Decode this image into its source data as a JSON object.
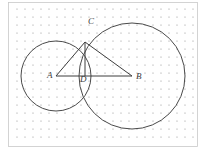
{
  "figure": {
    "canvas": {
      "width": 201,
      "height": 151
    },
    "background": {
      "color": "#ffffff",
      "grid": {
        "type": "dot-lattice",
        "spacing": 8.0,
        "origin_x": 13,
        "origin_y": 7,
        "dot_radius": 0.6,
        "color": "#8f8f8f"
      },
      "frame": {
        "left": 8.5,
        "top": 2.5,
        "right": 197.5,
        "bottom": 146.5,
        "color": "#c9c9c9",
        "width": 0.8
      }
    },
    "stroke": {
      "circle_color": "#4a4a4a",
      "circle_width": 1.0,
      "line_color": "#3d3d3d",
      "line_width": 1.0
    },
    "circles": [
      {
        "id": "circle-a",
        "center_label": "A",
        "cx": 56,
        "cy": 76,
        "r": 35
      },
      {
        "id": "circle-b",
        "center_label": "B",
        "cx": 132,
        "cy": 76,
        "r": 53
      }
    ],
    "points": [
      {
        "id": "point-a",
        "label": "A",
        "x": 56,
        "y": 76,
        "label_x": 47,
        "label_y": 78
      },
      {
        "id": "point-b",
        "label": "B",
        "x": 132,
        "y": 76,
        "label_x": 136,
        "label_y": 79
      },
      {
        "id": "point-c",
        "label": "C",
        "x": 85,
        "y": 42,
        "label_x": 88,
        "label_y": 24
      },
      {
        "id": "point-d",
        "label": "D",
        "x": 85,
        "y": 76,
        "label_x": 80,
        "label_y": 82
      }
    ],
    "segments": [
      {
        "id": "segment-ac",
        "from": "A",
        "to": "C",
        "x1": 56,
        "y1": 76,
        "x2": 85,
        "y2": 42
      },
      {
        "id": "segment-ab",
        "from": "A",
        "to": "B",
        "x1": 56,
        "y1": 76,
        "x2": 132,
        "y2": 76
      },
      {
        "id": "segment-cb",
        "from": "C",
        "to": "B",
        "x1": 85,
        "y1": 42,
        "x2": 132,
        "y2": 76
      },
      {
        "id": "segment-cd",
        "from": "C",
        "to": "D",
        "x1": 85,
        "y1": 42,
        "x2": 85,
        "y2": 76
      }
    ],
    "labels": {
      "a": "A",
      "b": "B",
      "c": "C",
      "d": "D"
    }
  }
}
